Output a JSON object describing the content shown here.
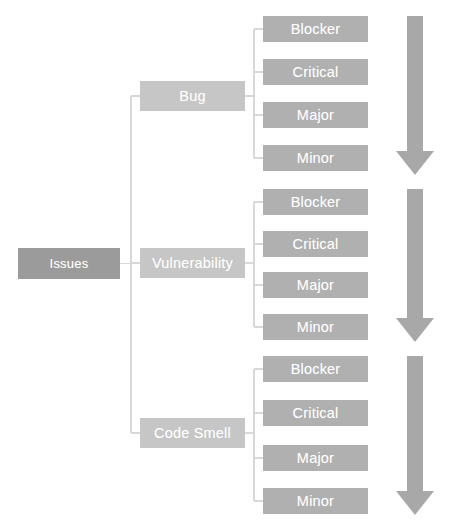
{
  "diagram": {
    "root": {
      "label": "Issues"
    },
    "categories": [
      {
        "label": "Bug"
      },
      {
        "label": "Vulnerability"
      },
      {
        "label": "Code Smell"
      }
    ],
    "severities": [
      "Blocker",
      "Critical",
      "Major",
      "Minor"
    ],
    "groups": [
      {
        "category": "Bug",
        "leaves": [
          "Blocker",
          "Critical",
          "Major",
          "Minor"
        ],
        "arrow": {
          "name": "severity-decreasing-arrow",
          "direction": "down"
        }
      },
      {
        "category": "Vulnerability",
        "leaves": [
          "Blocker",
          "Critical",
          "Major",
          "Minor"
        ],
        "arrow": {
          "name": "severity-decreasing-arrow",
          "direction": "down"
        }
      },
      {
        "category": "Code Smell",
        "leaves": [
          "Blocker",
          "Critical",
          "Major",
          "Minor"
        ],
        "arrow": {
          "name": "severity-decreasing-arrow",
          "direction": "down"
        }
      }
    ],
    "colors": {
      "root_fill": "#9b9b9b",
      "category_fill": "#c6c6c6",
      "severity_fill": "#b0b0b0",
      "arrow_fill": "#a8a8a8",
      "connector_line": "#d8d8d8",
      "label_text": "#ffffff",
      "background": "#ffffff"
    },
    "geometry": {
      "root": {
        "x": 18,
        "y": 248,
        "w": 102,
        "h": 31
      },
      "category_x": 140,
      "category_w": 105,
      "category_h": 30,
      "category_y": [
        81,
        248,
        418
      ],
      "severity_x": 263,
      "severity_w": 105,
      "severity_h": 26,
      "severity_y_groups": [
        [
          16,
          59,
          102,
          145
        ],
        [
          189,
          231,
          272,
          314
        ],
        [
          356,
          400,
          445,
          488
        ]
      ],
      "trunk_x": 131,
      "branch_x_offset": 9,
      "arrows": [
        {
          "top": 16,
          "bottom": 175
        },
        {
          "top": 189,
          "bottom": 342
        },
        {
          "top": 356,
          "bottom": 515
        }
      ],
      "arrow_shaft_x": 407,
      "arrow_shaft_w": 16,
      "arrow_head_x": 396,
      "arrow_head_w": 38,
      "arrow_head_h": 24
    }
  }
}
